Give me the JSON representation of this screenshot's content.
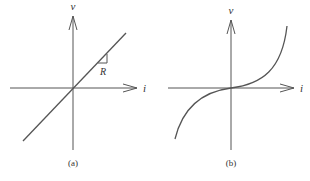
{
  "panels": [
    {
      "id": "a",
      "caption": "(a)",
      "x_axis_label": "i",
      "y_axis_label": "v",
      "curve_type": "linear",
      "slope_label": "R",
      "description": "Linear v-i characteristic through the origin with slope R"
    },
    {
      "id": "b",
      "caption": "(b)",
      "x_axis_label": "i",
      "y_axis_label": "v",
      "curve_type": "nonlinear-cubic",
      "description": "Nonlinear v-i characteristic through the origin, flat near origin and steepening away"
    }
  ],
  "colors": {
    "stroke": "#555555",
    "text": "#333333",
    "background": "#ffffff"
  }
}
